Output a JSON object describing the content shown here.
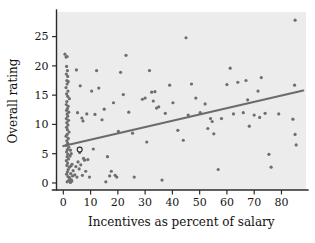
{
  "chart_data": {
    "type": "scatter",
    "title": "",
    "xlabel": "Incentives as percent of salary",
    "ylabel": "Overall rating",
    "xlim": [
      -2.5,
      89
    ],
    "ylim": [
      -1.2,
      29.2
    ],
    "xticks": [
      0,
      10,
      20,
      30,
      40,
      50,
      60,
      70,
      80
    ],
    "xtick_labels": [
      "0",
      "10",
      "20",
      "30",
      "40",
      "50",
      "60",
      "70",
      "80"
    ],
    "yticks": [
      0,
      5,
      10,
      15,
      20,
      25
    ],
    "ytick_labels": [
      "0",
      "5",
      "10",
      "15",
      "20",
      "25"
    ],
    "grid": false,
    "legend": null,
    "plot_background": "#ececec",
    "point_color": "#6e6e6e",
    "line_color": "#6b6b6b",
    "series": [
      {
        "name": "Firms",
        "marker": "filled-circle",
        "points": [
          [
            0.6,
            22.0
          ],
          [
            1.0,
            21.5
          ],
          [
            1.4,
            21.6
          ],
          [
            1.2,
            19.9
          ],
          [
            1.5,
            19.2
          ],
          [
            1.1,
            18.6
          ],
          [
            1.6,
            18.2
          ],
          [
            1.3,
            17.5
          ],
          [
            1.8,
            17.3
          ],
          [
            1.4,
            16.9
          ],
          [
            1.0,
            16.3
          ],
          [
            1.7,
            15.7
          ],
          [
            1.2,
            15.2
          ],
          [
            1.6,
            14.8
          ],
          [
            2.2,
            14.4
          ],
          [
            1.3,
            13.9
          ],
          [
            1.1,
            13.4
          ],
          [
            1.8,
            13.1
          ],
          [
            1.5,
            12.7
          ],
          [
            1.2,
            12.4
          ],
          [
            2.0,
            12.1
          ],
          [
            1.4,
            11.8
          ],
          [
            1.6,
            11.4
          ],
          [
            1.1,
            11.0
          ],
          [
            1.9,
            10.7
          ],
          [
            1.3,
            10.3
          ],
          [
            1.7,
            9.9
          ],
          [
            1.2,
            9.5
          ],
          [
            1.5,
            9.1
          ],
          [
            2.1,
            8.7
          ],
          [
            1.4,
            8.3
          ],
          [
            1.0,
            8.0
          ],
          [
            1.8,
            7.6
          ],
          [
            1.3,
            7.2
          ],
          [
            1.6,
            6.8
          ],
          [
            1.1,
            6.4
          ],
          [
            2.0,
            6.1
          ],
          [
            1.5,
            5.7
          ],
          [
            1.2,
            5.3
          ],
          [
            1.7,
            4.9
          ],
          [
            1.4,
            4.5
          ],
          [
            1.9,
            4.1
          ],
          [
            1.1,
            3.8
          ],
          [
            1.6,
            3.4
          ],
          [
            1.3,
            3.0
          ],
          [
            2.2,
            2.7
          ],
          [
            1.8,
            2.3
          ],
          [
            1.5,
            1.9
          ],
          [
            1.2,
            1.5
          ],
          [
            1.7,
            1.1
          ],
          [
            2.4,
            0.7
          ],
          [
            1.9,
            0.4
          ],
          [
            1.4,
            0.2
          ],
          [
            2.6,
            0.1
          ],
          [
            2.8,
            2.9
          ],
          [
            2.5,
            4.6
          ],
          [
            2.7,
            1.6
          ],
          [
            3.0,
            0.5
          ],
          [
            3.2,
            3.2
          ],
          [
            2.9,
            5.0
          ],
          [
            3.4,
            1.2
          ],
          [
            2.3,
            0.9
          ],
          [
            3.1,
            0.3
          ],
          [
            2.6,
            5.6
          ],
          [
            3.6,
            2.1
          ],
          [
            4.2,
            1.4
          ],
          [
            4.6,
            2.8
          ],
          [
            5.0,
            1.0
          ],
          [
            5.4,
            3.6
          ],
          [
            5.8,
            2.4
          ],
          [
            6.4,
            3.1
          ],
          [
            7.0,
            1.3
          ],
          [
            7.4,
            4.2
          ],
          [
            7.8,
            3.9
          ],
          [
            8.2,
            2.0
          ],
          [
            6.0,
            5.2
          ],
          [
            6.8,
            11.1
          ],
          [
            5.2,
            12.0
          ],
          [
            4.8,
            19.3
          ],
          [
            6.2,
            16.6
          ],
          [
            7.2,
            10.6
          ],
          [
            8.6,
            11.8
          ],
          [
            9.0,
            4.0
          ],
          [
            9.6,
            1.0
          ],
          [
            10.4,
            15.7
          ],
          [
            11.0,
            5.8
          ],
          [
            11.6,
            11.7
          ],
          [
            12.2,
            19.2
          ],
          [
            13.0,
            16.2
          ],
          [
            14.2,
            10.8
          ],
          [
            15.0,
            12.6
          ],
          [
            15.6,
            0.2
          ],
          [
            16.2,
            4.5
          ],
          [
            17.0,
            1.2
          ],
          [
            17.6,
            2.0
          ],
          [
            18.4,
            13.7
          ],
          [
            19.0,
            1.3
          ],
          [
            19.6,
            1.0
          ],
          [
            20.2,
            8.8
          ],
          [
            21.0,
            18.9
          ],
          [
            22.0,
            15.1
          ],
          [
            23.0,
            21.8
          ],
          [
            24.0,
            12.1
          ],
          [
            25.4,
            8.5
          ],
          [
            26.0,
            1.0
          ],
          [
            29.0,
            14.3
          ],
          [
            30.0,
            14.5
          ],
          [
            30.6,
            7.0
          ],
          [
            31.6,
            19.2
          ],
          [
            32.4,
            15.5
          ],
          [
            33.0,
            14.0
          ],
          [
            33.6,
            15.6
          ],
          [
            34.2,
            12.8
          ],
          [
            35.0,
            13.0
          ],
          [
            36.2,
            0.5
          ],
          [
            37.4,
            11.9
          ],
          [
            39.0,
            16.7
          ],
          [
            40.2,
            13.7
          ],
          [
            42.0,
            9.0
          ],
          [
            44.0,
            7.3
          ],
          [
            45.0,
            24.8
          ],
          [
            45.8,
            11.6
          ],
          [
            47.0,
            16.9
          ],
          [
            48.6,
            14.5
          ],
          [
            50.2,
            12.0
          ],
          [
            52.0,
            13.5
          ],
          [
            53.0,
            9.3
          ],
          [
            54.0,
            11.0
          ],
          [
            54.6,
            10.5
          ],
          [
            55.2,
            8.4
          ],
          [
            56.8,
            2.3
          ],
          [
            58.0,
            11.0
          ],
          [
            60.0,
            16.8
          ],
          [
            61.2,
            19.6
          ],
          [
            62.4,
            11.8
          ],
          [
            64.0,
            17.2
          ],
          [
            66.0,
            12.0
          ],
          [
            67.0,
            17.5
          ],
          [
            67.6,
            14.2
          ],
          [
            68.2,
            9.7
          ],
          [
            70.0,
            11.6
          ],
          [
            71.4,
            15.7
          ],
          [
            72.0,
            11.2
          ],
          [
            72.6,
            18.0
          ],
          [
            74.0,
            11.9
          ],
          [
            75.4,
            4.9
          ],
          [
            76.2,
            2.7
          ],
          [
            79.0,
            11.8
          ],
          [
            84.2,
            10.9
          ],
          [
            84.8,
            16.7
          ],
          [
            85.0,
            8.3
          ],
          [
            85.4,
            6.5
          ],
          [
            85.0,
            27.8
          ]
        ]
      },
      {
        "name": "Highlighted firm",
        "marker": "open-circle",
        "points": [
          [
            6.0,
            5.7
          ]
        ]
      }
    ],
    "fit_line": {
      "type": "linear-regression",
      "x_start": 0.0,
      "y_start": 6.3,
      "x_end": 88.0,
      "y_end": 15.8
    }
  }
}
